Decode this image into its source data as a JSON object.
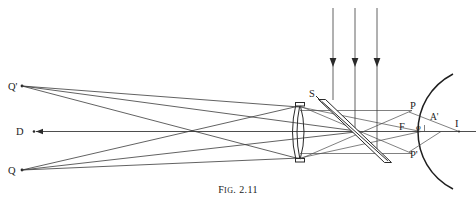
{
  "figure": {
    "caption_prefix": "F",
    "caption_smallcaps": "IG",
    "caption_number": ". 2.11",
    "caption_full": "Fig. 2.11"
  },
  "labels": {
    "q_prime": "Q'",
    "d": "D",
    "q": "Q",
    "s": "S",
    "p": "P",
    "p_prime": "P'",
    "a_prime": "A'",
    "f": "F",
    "phi": "φ",
    "i": "I"
  },
  "elements": {
    "lens_name": "biconvex-lens",
    "splitter_name": "beam-splitter-plate",
    "mirror_name": "concave-mirror-arc",
    "axis_name": "optical-axis",
    "incoming_rays_count": 3
  },
  "geometry": {
    "width": 476,
    "height": 205,
    "axis_y": 132,
    "lens_x": 300,
    "lens_top_y": 103,
    "lens_bottom_y": 161,
    "crossing_x": 207,
    "crossing_y": 133,
    "mirror_vertex_x": 421,
    "upper_ray_y": 111,
    "lower_ray_y": 153,
    "incoming_ray_x": [
      333,
      355,
      377
    ],
    "incoming_ray_top_y": 8,
    "incoming_arrow_y": 62,
    "q_prime_point": [
      22,
      86
    ],
    "d_point": [
      33,
      131
    ],
    "q_point": [
      22,
      170
    ],
    "p_point": [
      409,
      111
    ],
    "p_prime_point": [
      409,
      154
    ],
    "i_point": [
      459,
      132
    ],
    "f_point": [
      405,
      132
    ]
  },
  "colors": {
    "ink": "#2a2a2a",
    "ray": "#3a3a3a",
    "background": "#ffffff"
  }
}
